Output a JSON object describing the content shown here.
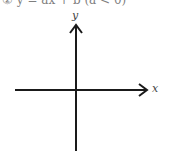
{
  "caption": "② y = ax + b (a < 0)",
  "axes": {
    "x_label": "x",
    "y_label": "y",
    "origin": [
      76,
      90
    ],
    "x_range_px": [
      15,
      147
    ],
    "y_range_px": [
      25,
      150
    ],
    "stroke_color": "#1a1a1a"
  }
}
